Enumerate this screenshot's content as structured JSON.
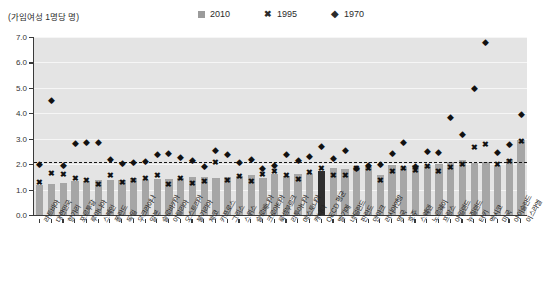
{
  "header": {
    "unit_label": "(가임여성 1명당 명)",
    "legend": [
      {
        "name": "2010",
        "marker": "square",
        "color": "#9b9b9b"
      },
      {
        "name": "1995",
        "marker": "x",
        "color": "#111111"
      },
      {
        "name": "1970",
        "marker": "diamond",
        "color": "#111111"
      }
    ]
  },
  "chart_data": {
    "type": "bar",
    "title": "",
    "xlabel": "",
    "ylabel": "(가임여성 1명당 명)",
    "ylim": [
      0.0,
      7.0
    ],
    "yticks": [
      "0.0",
      "1.0",
      "2.0",
      "3.0",
      "4.0",
      "5.0",
      "6.0",
      "7.0"
    ],
    "grid": true,
    "legend_position": "top",
    "reference_line": {
      "value": 2.1,
      "style": "dashed",
      "color": "#141414"
    },
    "categories": [
      "라트비아",
      "대한민국",
      "헝가리",
      "포르투갈",
      "루마니아",
      "스페인",
      "폴란드",
      "독일",
      "우크라이나",
      "일본",
      "슬로바키아",
      "이탈리아",
      "오스트리아",
      "불가리아",
      "체코",
      "키프로스",
      "그리스",
      "스위스",
      "슬로베니아",
      "크로아티아",
      "룩셈부르크",
      "리투아니아",
      "에스토니아",
      "캐나다",
      "OECD 평균",
      "벨기에",
      "네덜란드",
      "핀란드",
      "덴마크",
      "러시아연방",
      "영국",
      "호주",
      "스웨덴",
      "노르웨이",
      "프랑스",
      "아일랜드",
      "뉴질랜드",
      "터키",
      "멕시코",
      "미국",
      "아이슬란드",
      "이스라엘"
    ],
    "series": [
      {
        "name": "2010",
        "marker": "bar",
        "values": [
          1.17,
          1.23,
          1.25,
          1.32,
          1.33,
          1.38,
          1.38,
          1.39,
          1.44,
          1.39,
          1.4,
          1.41,
          1.44,
          1.49,
          1.49,
          1.44,
          1.51,
          1.52,
          1.57,
          1.46,
          1.63,
          1.55,
          1.63,
          1.63,
          1.74,
          1.84,
          1.8,
          1.87,
          1.88,
          1.57,
          1.98,
          1.89,
          1.98,
          1.95,
          2.01,
          2.07,
          2.17,
          2.05,
          2.08,
          1.93,
          2.2,
          2.96
        ]
      },
      {
        "name": "1995",
        "marker": "x",
        "values": [
          1.26,
          1.63,
          1.57,
          1.41,
          1.33,
          1.18,
          1.55,
          1.25,
          1.34,
          1.42,
          1.52,
          1.19,
          1.4,
          1.23,
          1.28,
          2.03,
          1.32,
          1.48,
          1.29,
          1.58,
          1.7,
          1.55,
          1.38,
          1.67,
          1.8,
          1.55,
          1.53,
          1.81,
          1.8,
          1.34,
          1.71,
          1.82,
          1.73,
          1.87,
          1.71,
          1.84,
          1.98,
          2.64,
          2.74,
          1.98,
          2.08,
          2.88
        ]
      },
      {
        "name": "1970",
        "marker": "diamond",
        "values": [
          2.02,
          4.53,
          1.98,
          2.83,
          2.89,
          2.88,
          2.2,
          2.03,
          2.07,
          2.13,
          2.4,
          2.42,
          2.29,
          2.17,
          1.92,
          2.54,
          2.39,
          2.1,
          2.21,
          1.83,
          1.97,
          2.4,
          2.16,
          2.33,
          2.7,
          2.25,
          2.57,
          1.83,
          1.95,
          2.0,
          2.43,
          2.86,
          1.92,
          2.5,
          2.47,
          3.87,
          3.17,
          5.0,
          6.82,
          2.48,
          2.81,
          3.97
        ]
      }
    ]
  }
}
